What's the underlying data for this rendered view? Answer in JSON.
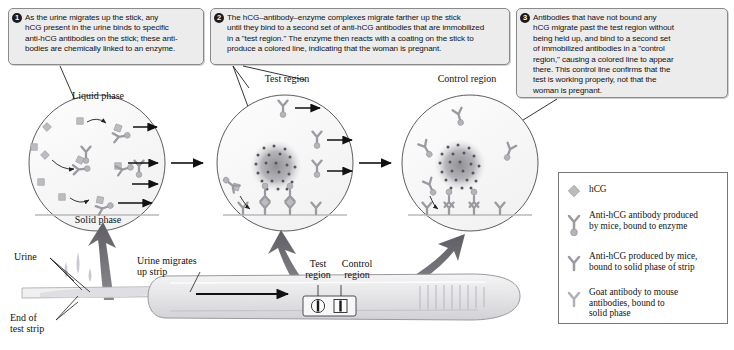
{
  "figure": {
    "colors": {
      "callout_fill": "#ececed",
      "callout_border": "#8a8a8a",
      "badge_fill": "#1b1b1b",
      "particle_gray": "#a8a8ac",
      "antibody_gray": "#9a9aa0",
      "blob_gray": "#8c8c92",
      "arrow_black": "#111111",
      "big_arrow_gray": "#6f6f74",
      "stick_fill": "#e9e9ea",
      "stick_edge": "#9a9a9e"
    }
  },
  "callouts": [
    {
      "number": "1",
      "text": "As the urine migrates up the stick, any\nhCG present in the urine binds to specific\nanti-hCG antibodies on the stick; these anti-\nbodies are chemically linked to an enzyme."
    },
    {
      "number": "2",
      "text": "The hCG–antibody–enzyme complexes migrate farther up the stick\nuntil they bind to a second set of anti-hCG antibodies that are immobilized\nin a \"test region.\" The enzyme then reacts with a coating on the stick to\nproduce a colored line, indicating that the woman is pregnant."
    },
    {
      "number": "3",
      "text": "Antibodies that have not bound any\nhCG migrate past the test region without\nbeing held up, and bind to a second set\nof immobilized antibodies in a \"control\nregion,\" causing a colored line to appear\nthere. This control line confirms that the\ntest is working properly, not that the\nwoman is pregnant."
    }
  ],
  "panel_labels": {
    "liquid_phase": "Liquid phase",
    "solid_phase": "Solid phase",
    "test_region": "Test region",
    "control_region": "Control region"
  },
  "stick_labels": {
    "urine": "Urine",
    "urine_migrates": "Urine migrates\nup strip",
    "end_of_test_strip": "End of\ntest strip",
    "test_region": "Test\nregion",
    "control_region": "Control\nregion"
  },
  "legend": {
    "items": [
      {
        "icon": "diamond-hcg-icon",
        "label": "hCG"
      },
      {
        "icon": "antibody-enzyme-icon",
        "label": "Anti-hCG antibody produced\nby mice, bound to enzyme"
      },
      {
        "icon": "antibody-solid-icon",
        "label": "Anti-hCG produced by mice,\nbound to solid phase of strip"
      },
      {
        "icon": "goat-antibody-icon",
        "label": "Goat antibody to mouse\nantibodies, bound to\nsolid phase"
      }
    ]
  }
}
